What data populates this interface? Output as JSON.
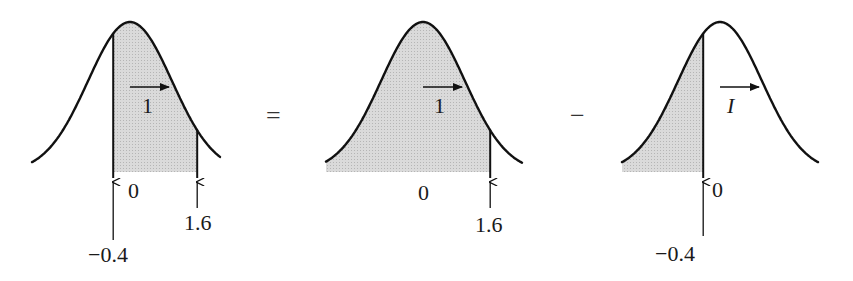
{
  "figure": {
    "shade_color": "#d4d4d4",
    "line_color": "#111111",
    "operators": {
      "equals": "=",
      "minus": "−"
    },
    "panels": [
      {
        "id": "panel-between",
        "shaded_from": -0.4,
        "shaded_to": 1.6,
        "unit_label": "1",
        "labels": {
          "zero": "0",
          "upper": "1.6",
          "lower": "−0.4"
        }
      },
      {
        "id": "panel-left-of-upper",
        "shaded_from": null,
        "shaded_to": 1.6,
        "unit_label": "1",
        "labels": {
          "zero": "0",
          "upper": "1.6"
        }
      },
      {
        "id": "panel-left-of-lower",
        "shaded_from": null,
        "shaded_to": -0.4,
        "unit_label": "I",
        "labels": {
          "zero": "0",
          "lower": "−0.4"
        }
      }
    ]
  }
}
